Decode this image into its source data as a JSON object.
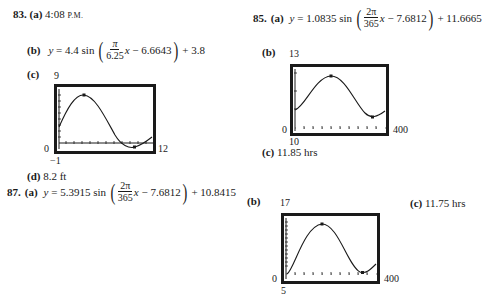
{
  "problems": {
    "p83": {
      "number": "83.",
      "a": {
        "label": "(a)",
        "time": "4:08",
        "suffix": "P.M."
      },
      "b": {
        "label": "(b)",
        "lhs": "y",
        "amp": "4.4",
        "func": "sin",
        "num": "π",
        "den": "6.25",
        "var": "x",
        "shift": "− 6.6643",
        "vshift": "+ 3.8"
      },
      "c": {
        "label": "(c)",
        "ymax": "9",
        "ymin": "−1",
        "xmin": "0",
        "xmax": "12"
      },
      "d": {
        "label": "(d)",
        "value": "8.2 ft"
      }
    },
    "p85": {
      "number": "85.",
      "a": {
        "label": "(a)",
        "lhs": "y",
        "amp": "1.0835",
        "func": "sin",
        "num": "2π",
        "den": "365",
        "var": "x",
        "shift": "− 7.6812",
        "vshift": "+ 11.6665"
      },
      "b": {
        "label": "(b)",
        "ymax": "13",
        "ymin": "10",
        "xmin": "0",
        "xmax": "400"
      },
      "c": {
        "label": "(c)",
        "value": "11.85 hrs"
      }
    },
    "p87": {
      "number": "87.",
      "a": {
        "label": "(a)",
        "lhs": "y",
        "amp": "5.3915",
        "func": "sin",
        "num": "2π",
        "den": "365",
        "var": "x",
        "shift": "− 7.6812",
        "vshift": "+ 10.8415"
      },
      "b": {
        "label": "(b)",
        "ymax": "17",
        "ymin": "5",
        "xmin": "0",
        "xmax": "400"
      },
      "c": {
        "label": "(c)",
        "value": "11.75 hrs"
      }
    }
  },
  "colors": {
    "ink": "#1a1a1a",
    "background": "#ffffff"
  }
}
